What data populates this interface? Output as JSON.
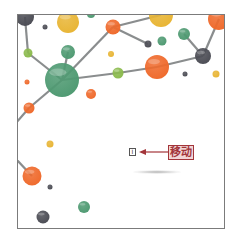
{
  "canvas": {
    "width": 236,
    "height": 239,
    "frame": {
      "x": 17,
      "y": 14,
      "w": 208,
      "h": 215,
      "border_color": "#7b7b7b"
    }
  },
  "graphic": {
    "description": "molecular network illustration",
    "colors": {
      "green": "#4f9a72",
      "light_green": "#8cbb4e",
      "orange": "#ef6a2c",
      "yellow": "#e8b535",
      "dark_gray": "#4c4d55",
      "line": "#8a8d8e"
    },
    "nodes": [
      {
        "x": 24,
        "y": 16,
        "r": 9,
        "color": "dark_gray"
      },
      {
        "x": 44,
        "y": 26,
        "r": 2.5,
        "color": "dark_gray"
      },
      {
        "x": 67,
        "y": 21,
        "r": 11,
        "color": "yellow"
      },
      {
        "x": 90,
        "y": 13,
        "r": 4,
        "color": "green"
      },
      {
        "x": 112,
        "y": 26,
        "r": 7.5,
        "color": "orange"
      },
      {
        "x": 160,
        "y": 14,
        "r": 12,
        "color": "yellow"
      },
      {
        "x": 218,
        "y": 18,
        "r": 11,
        "color": "orange"
      },
      {
        "x": 147,
        "y": 43,
        "r": 3.5,
        "color": "dark_gray"
      },
      {
        "x": 161,
        "y": 40,
        "r": 4.5,
        "color": "green"
      },
      {
        "x": 183,
        "y": 33,
        "r": 6,
        "color": "green"
      },
      {
        "x": 202,
        "y": 55,
        "r": 8,
        "color": "dark_gray"
      },
      {
        "x": 110,
        "y": 53,
        "r": 3,
        "color": "yellow"
      },
      {
        "x": 67,
        "y": 51,
        "r": 7,
        "color": "green"
      },
      {
        "x": 27,
        "y": 52,
        "r": 4.5,
        "color": "light_green"
      },
      {
        "x": 61,
        "y": 79,
        "r": 17,
        "color": "green"
      },
      {
        "x": 117,
        "y": 72,
        "r": 5.5,
        "color": "light_green"
      },
      {
        "x": 156,
        "y": 66,
        "r": 12,
        "color": "orange"
      },
      {
        "x": 184,
        "y": 73,
        "r": 2.5,
        "color": "dark_gray"
      },
      {
        "x": 215,
        "y": 73,
        "r": 3.5,
        "color": "yellow"
      },
      {
        "x": 26,
        "y": 81,
        "r": 2.5,
        "color": "orange"
      },
      {
        "x": 90,
        "y": 93,
        "r": 5,
        "color": "orange"
      },
      {
        "x": 28,
        "y": 107,
        "r": 5.5,
        "color": "orange"
      },
      {
        "x": 49,
        "y": 143,
        "r": 3.5,
        "color": "yellow"
      },
      {
        "x": 31,
        "y": 175,
        "r": 9.5,
        "color": "orange"
      },
      {
        "x": 49,
        "y": 186,
        "r": 2.5,
        "color": "dark_gray"
      },
      {
        "x": 83,
        "y": 206,
        "r": 6,
        "color": "green"
      },
      {
        "x": 42,
        "y": 216,
        "r": 6.5,
        "color": "dark_gray"
      }
    ],
    "edges": [
      [
        24,
        16,
        27,
        52
      ],
      [
        27,
        52,
        61,
        79
      ],
      [
        67,
        51,
        61,
        79
      ],
      [
        61,
        79,
        112,
        26
      ],
      [
        112,
        26,
        147,
        43
      ],
      [
        112,
        26,
        160,
        14
      ],
      [
        61,
        79,
        117,
        72
      ],
      [
        117,
        72,
        156,
        66
      ],
      [
        156,
        66,
        202,
        55
      ],
      [
        202,
        55,
        218,
        18
      ],
      [
        183,
        33,
        202,
        55
      ],
      [
        61,
        79,
        28,
        107
      ],
      [
        28,
        107,
        15,
        122
      ],
      [
        15,
        158,
        31,
        175
      ]
    ]
  },
  "annotation": {
    "cursor_icon_glyph": "I",
    "arrow_color": "#a3353a",
    "label": "移动",
    "label_color": "#a3353a",
    "label_bg": "#f1d6d6"
  }
}
